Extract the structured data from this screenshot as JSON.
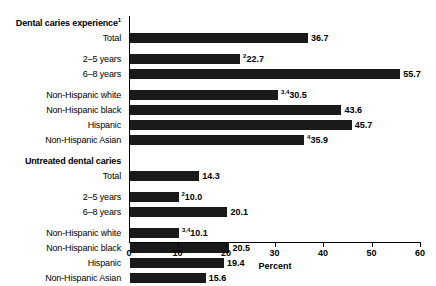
{
  "chart_data": {
    "type": "bar",
    "orientation": "horizontal",
    "title": "",
    "xlabel": "Percent",
    "ylabel": "",
    "xlim": [
      0,
      60
    ],
    "xticks": [
      0,
      10,
      20,
      30,
      40,
      50,
      60
    ],
    "grid": false,
    "legend": null,
    "bar_color": "#1a1a1a",
    "rows": [
      {
        "label": "Dental caries experience",
        "sup": "1",
        "heading": true,
        "value": null,
        "value_label": "",
        "value_sup": ""
      },
      {
        "label": "Total",
        "sup": "",
        "heading": false,
        "value": 36.7,
        "value_label": "36.7",
        "value_sup": ""
      },
      {
        "label": "",
        "sup": "",
        "heading": false,
        "value": null,
        "value_label": "",
        "value_sup": "",
        "spacer": true
      },
      {
        "label": "2–5 years",
        "sup": "",
        "heading": false,
        "value": 22.7,
        "value_label": "22.7",
        "value_sup": "2"
      },
      {
        "label": "6–8 years",
        "sup": "",
        "heading": false,
        "value": 55.7,
        "value_label": "55.7",
        "value_sup": ""
      },
      {
        "label": "",
        "sup": "",
        "heading": false,
        "value": null,
        "value_label": "",
        "value_sup": "",
        "spacer": true
      },
      {
        "label": "Non-Hispanic white",
        "sup": "",
        "heading": false,
        "value": 30.5,
        "value_label": "30.5",
        "value_sup": "3,4"
      },
      {
        "label": "Non-Hispanic black",
        "sup": "",
        "heading": false,
        "value": 43.6,
        "value_label": "43.6",
        "value_sup": ""
      },
      {
        "label": "Hispanic",
        "sup": "",
        "heading": false,
        "value": 45.7,
        "value_label": "45.7",
        "value_sup": ""
      },
      {
        "label": "Non-Hispanic Asian",
        "sup": "",
        "heading": false,
        "value": 35.9,
        "value_label": "35.9",
        "value_sup": "4"
      },
      {
        "label": "",
        "sup": "",
        "heading": false,
        "value": null,
        "value_label": "",
        "value_sup": "",
        "spacer": true
      },
      {
        "label": "Untreated dental caries",
        "sup": "",
        "heading": true,
        "value": null,
        "value_label": "",
        "value_sup": ""
      },
      {
        "label": "Total",
        "sup": "",
        "heading": false,
        "value": 14.3,
        "value_label": "14.3",
        "value_sup": ""
      },
      {
        "label": "",
        "sup": "",
        "heading": false,
        "value": null,
        "value_label": "",
        "value_sup": "",
        "spacer": true
      },
      {
        "label": "2–5 years",
        "sup": "",
        "heading": false,
        "value": 10.0,
        "value_label": "10.0",
        "value_sup": "2"
      },
      {
        "label": "6–8 years",
        "sup": "",
        "heading": false,
        "value": 20.1,
        "value_label": "20.1",
        "value_sup": ""
      },
      {
        "label": "",
        "sup": "",
        "heading": false,
        "value": null,
        "value_label": "",
        "value_sup": "",
        "spacer": true
      },
      {
        "label": "Non-Hispanic white",
        "sup": "",
        "heading": false,
        "value": 10.1,
        "value_label": "10.1",
        "value_sup": "3,4"
      },
      {
        "label": "Non-Hispanic black",
        "sup": "",
        "heading": false,
        "value": 20.5,
        "value_label": "20.5",
        "value_sup": ""
      },
      {
        "label": "Hispanic",
        "sup": "",
        "heading": false,
        "value": 19.4,
        "value_label": "19.4",
        "value_sup": ""
      },
      {
        "label": "Non-Hispanic Asian",
        "sup": "",
        "heading": false,
        "value": 15.6,
        "value_label": "15.6",
        "value_sup": ""
      }
    ]
  },
  "axis": {
    "title": "Percent",
    "tick_labels": [
      "0",
      "10",
      "20",
      "30",
      "40",
      "50",
      "60"
    ]
  }
}
